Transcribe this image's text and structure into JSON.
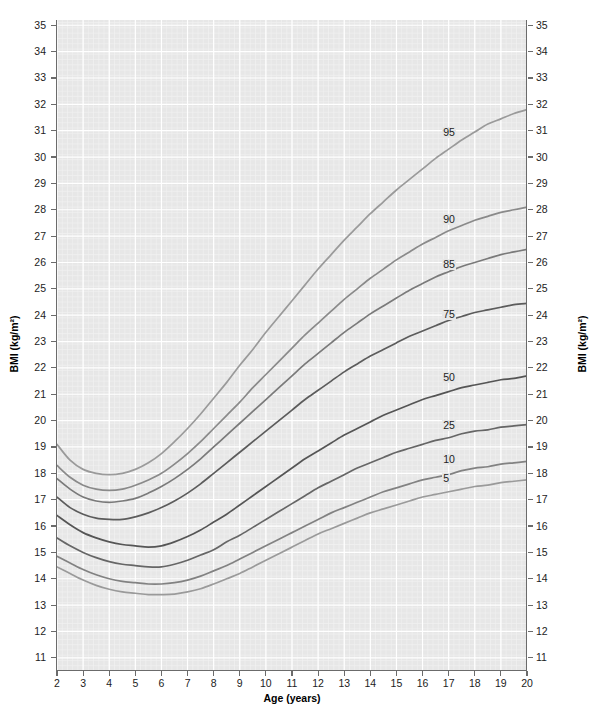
{
  "chart_data": {
    "type": "line",
    "title": "",
    "xlabel": "Age (years)",
    "ylabel": "BMI (kg/m²)",
    "ylabel_right": "BMI (kg/m²)",
    "xlim": [
      2,
      20
    ],
    "ylim": [
      10.5,
      35.2
    ],
    "xticks": [
      2,
      3,
      4,
      5,
      6,
      7,
      8,
      9,
      10,
      11,
      12,
      13,
      14,
      15,
      16,
      17,
      18,
      19,
      20
    ],
    "yticks": [
      11,
      12,
      13,
      14,
      15,
      16,
      17,
      18,
      19,
      20,
      21,
      22,
      23,
      24,
      25,
      26,
      27,
      28,
      29,
      30,
      31,
      32,
      33,
      34,
      35
    ],
    "grid": true,
    "legend_position": "inline-right-labels",
    "x": [
      2,
      2.5,
      3,
      3.5,
      4,
      4.5,
      5,
      5.5,
      6,
      6.5,
      7,
      7.5,
      8,
      8.5,
      9,
      9.5,
      10,
      10.5,
      11,
      11.5,
      12,
      12.5,
      13,
      13.5,
      14,
      14.5,
      15,
      15.5,
      16,
      16.5,
      17,
      17.5,
      18,
      18.5,
      19,
      19.5,
      20
    ],
    "series": [
      {
        "name": "95",
        "label": "95",
        "color": "#9a9a9a",
        "label_x": 17.1,
        "label_y": 30.9,
        "values": [
          19.1,
          18.5,
          18.15,
          18.0,
          17.95,
          18.0,
          18.15,
          18.4,
          18.75,
          19.2,
          19.7,
          20.25,
          20.85,
          21.45,
          22.1,
          22.7,
          23.35,
          23.95,
          24.55,
          25.15,
          25.75,
          26.3,
          26.85,
          27.35,
          27.85,
          28.3,
          28.75,
          29.15,
          29.55,
          29.95,
          30.3,
          30.65,
          30.95,
          31.25,
          31.45,
          31.65,
          31.8
        ]
      },
      {
        "name": "90",
        "label": "90",
        "color": "#8a8a8a",
        "label_x": 17.1,
        "label_y": 27.6,
        "values": [
          18.3,
          17.85,
          17.55,
          17.4,
          17.35,
          17.4,
          17.55,
          17.75,
          18.0,
          18.35,
          18.75,
          19.2,
          19.7,
          20.2,
          20.7,
          21.25,
          21.75,
          22.25,
          22.75,
          23.25,
          23.7,
          24.15,
          24.6,
          25.0,
          25.4,
          25.75,
          26.1,
          26.4,
          26.7,
          26.95,
          27.2,
          27.4,
          27.6,
          27.75,
          27.9,
          28.0,
          28.1
        ]
      },
      {
        "name": "85",
        "label": "85",
        "color": "#7a7a7a",
        "label_x": 17.1,
        "label_y": 25.9,
        "values": [
          17.8,
          17.4,
          17.1,
          16.95,
          16.9,
          16.95,
          17.05,
          17.25,
          17.5,
          17.8,
          18.15,
          18.55,
          19.0,
          19.45,
          19.9,
          20.35,
          20.8,
          21.25,
          21.7,
          22.15,
          22.55,
          22.95,
          23.35,
          23.7,
          24.05,
          24.35,
          24.65,
          24.95,
          25.2,
          25.45,
          25.65,
          25.85,
          26.0,
          26.15,
          26.3,
          26.4,
          26.5
        ]
      },
      {
        "name": "75",
        "label": "75",
        "color": "#5c5c5c",
        "label_x": 17.1,
        "label_y": 24.0,
        "values": [
          17.1,
          16.7,
          16.45,
          16.3,
          16.25,
          16.25,
          16.35,
          16.5,
          16.7,
          16.95,
          17.25,
          17.6,
          18.0,
          18.4,
          18.8,
          19.2,
          19.6,
          20.0,
          20.4,
          20.8,
          21.15,
          21.5,
          21.85,
          22.15,
          22.45,
          22.7,
          22.95,
          23.2,
          23.4,
          23.6,
          23.8,
          23.95,
          24.1,
          24.2,
          24.3,
          24.4,
          24.45
        ]
      },
      {
        "name": "50",
        "label": "50",
        "color": "#555555",
        "label_x": 17.1,
        "label_y": 21.6,
        "values": [
          16.4,
          16.05,
          15.75,
          15.55,
          15.4,
          15.3,
          15.25,
          15.2,
          15.25,
          15.4,
          15.6,
          15.85,
          16.15,
          16.45,
          16.8,
          17.15,
          17.5,
          17.85,
          18.2,
          18.55,
          18.85,
          19.15,
          19.45,
          19.7,
          19.95,
          20.2,
          20.4,
          20.6,
          20.8,
          20.95,
          21.1,
          21.25,
          21.35,
          21.45,
          21.55,
          21.6,
          21.7
        ]
      },
      {
        "name": "25",
        "label": "25",
        "color": "#666666",
        "label_x": 17.1,
        "label_y": 19.8,
        "values": [
          15.55,
          15.25,
          15.0,
          14.8,
          14.65,
          14.55,
          14.5,
          14.45,
          14.45,
          14.55,
          14.7,
          14.9,
          15.1,
          15.4,
          15.65,
          15.95,
          16.25,
          16.55,
          16.85,
          17.15,
          17.45,
          17.7,
          17.95,
          18.2,
          18.4,
          18.6,
          18.8,
          18.95,
          19.1,
          19.25,
          19.35,
          19.5,
          19.6,
          19.65,
          19.75,
          19.8,
          19.85
        ]
      },
      {
        "name": "10",
        "label": "10",
        "color": "#828282",
        "label_x": 17.1,
        "label_y": 18.5,
        "values": [
          14.85,
          14.6,
          14.35,
          14.15,
          14.0,
          13.9,
          13.85,
          13.8,
          13.8,
          13.85,
          13.95,
          14.1,
          14.3,
          14.5,
          14.75,
          15.0,
          15.25,
          15.5,
          15.75,
          16.0,
          16.25,
          16.5,
          16.7,
          16.9,
          17.1,
          17.3,
          17.45,
          17.6,
          17.75,
          17.85,
          17.95,
          18.1,
          18.2,
          18.25,
          18.35,
          18.4,
          18.45
        ]
      },
      {
        "name": "5",
        "label": "5",
        "color": "#9a9a9a",
        "label_x": 17.1,
        "label_y": 17.8,
        "values": [
          14.45,
          14.2,
          13.95,
          13.75,
          13.6,
          13.5,
          13.45,
          13.4,
          13.4,
          13.42,
          13.5,
          13.62,
          13.8,
          14.0,
          14.2,
          14.45,
          14.7,
          14.95,
          15.2,
          15.45,
          15.7,
          15.9,
          16.1,
          16.3,
          16.5,
          16.65,
          16.8,
          16.95,
          17.1,
          17.2,
          17.3,
          17.4,
          17.5,
          17.55,
          17.65,
          17.7,
          17.75
        ]
      }
    ]
  }
}
